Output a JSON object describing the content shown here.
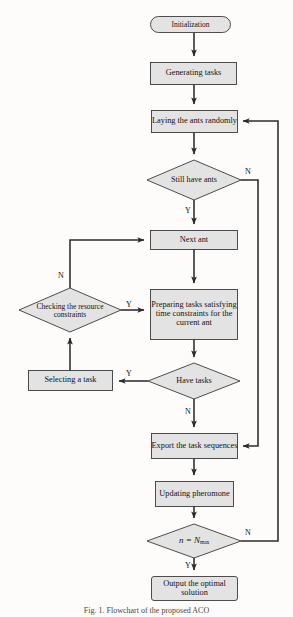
{
  "figure": {
    "caption": "Fig. 1. Flowchart of the proposed ACO",
    "node_fill": "#e3e3e3",
    "node_stroke": "#3a3a3a",
    "line_color": "#2b2b2b"
  },
  "nodes": [
    {
      "id": "initialization",
      "type": "terminator",
      "label": "Initialization"
    },
    {
      "id": "generating-tasks",
      "type": "process",
      "label": "Generating tasks"
    },
    {
      "id": "laying-ants",
      "type": "process",
      "label": "Laying the ants randomly"
    },
    {
      "id": "still-have-ants",
      "type": "decision",
      "label": "Still have ants"
    },
    {
      "id": "next-ant",
      "type": "process",
      "label": "Next ant"
    },
    {
      "id": "preparing-tasks",
      "type": "process",
      "label": "Preparing tasks satisfying time constraints for the current ant"
    },
    {
      "id": "checking-resource",
      "type": "decision",
      "label": "Checking the resource constraints"
    },
    {
      "id": "have-tasks",
      "type": "decision",
      "label": "Have tasks"
    },
    {
      "id": "selecting-task",
      "type": "process",
      "label": "Selecting a task"
    },
    {
      "id": "export-sequences",
      "type": "process",
      "label": "Export the task sequences"
    },
    {
      "id": "updating-pheromone",
      "type": "process",
      "label": "Updating pheromone"
    },
    {
      "id": "n-equals-nmax",
      "type": "decision",
      "label": "n = Nmax",
      "math": {
        "variable": "n",
        "operator": "=",
        "limit": "N",
        "subscript": "max"
      }
    },
    {
      "id": "output-optimal",
      "type": "terminator",
      "label": "Output the optimal solution"
    }
  ],
  "branches": [
    {
      "id": "still-have-ants-no",
      "label": "N"
    },
    {
      "id": "still-have-ants-yes",
      "label": "Y"
    },
    {
      "id": "checking-resource-no",
      "label": "N"
    },
    {
      "id": "checking-resource-yes",
      "label": "Y"
    },
    {
      "id": "have-tasks-yes",
      "label": "Y"
    },
    {
      "id": "have-tasks-no",
      "label": "N"
    },
    {
      "id": "n-equals-nmax-no",
      "label": "N"
    },
    {
      "id": "n-equals-nmax-yes",
      "label": "Y"
    }
  ]
}
